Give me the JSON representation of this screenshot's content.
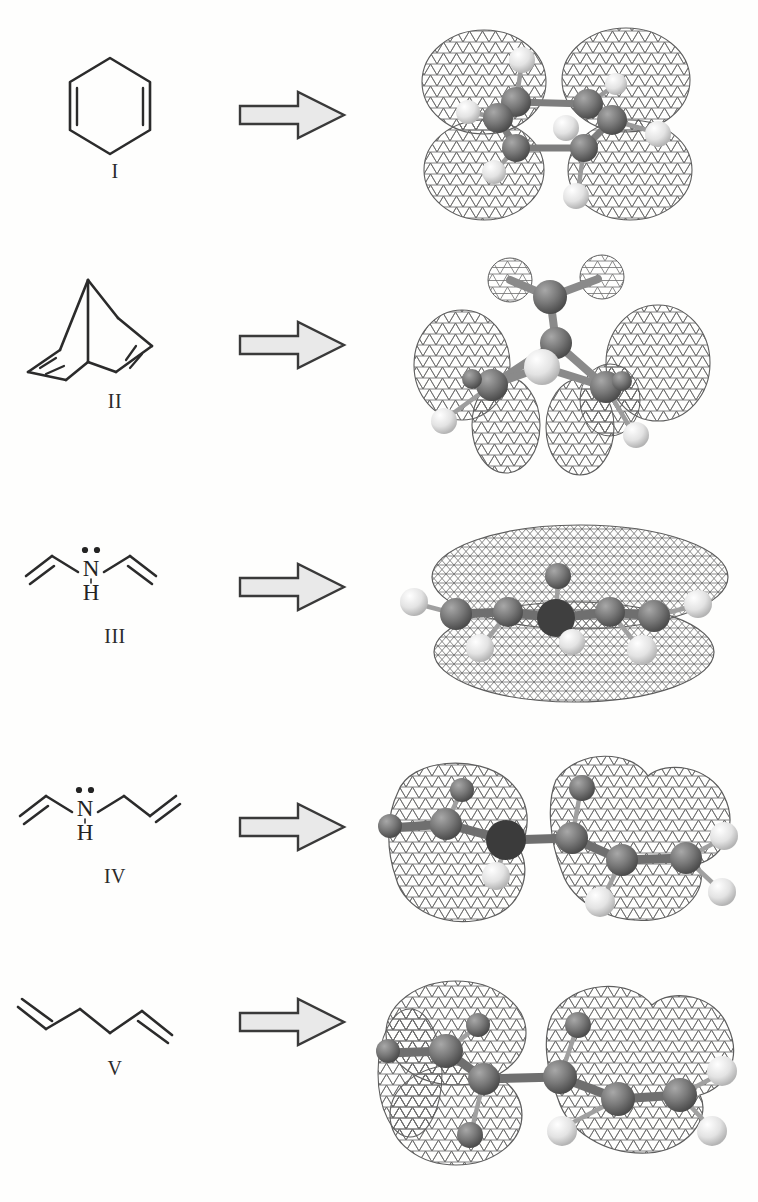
{
  "figure": {
    "type": "chemistry-scheme",
    "background_color": "#fdfdfc",
    "ink_color": "#2b2b2b",
    "arrow_fill": "#e9e9e9",
    "arrow_stroke": "#3a3a3a",
    "mesh_color": "#5a5a5a",
    "carbon_color": "#6b6b6b",
    "hydrogen_color": "#e8e8e8"
  },
  "rows": [
    {
      "label": "I",
      "structure_name": "1,3-cyclohexadiene",
      "structure_kind": "hexagon-diene",
      "arrow_icon": "block-arrow-right-icon",
      "mo_caption": "four-lobe pi antibonding isosurface",
      "mo_kind": "four-lobe"
    },
    {
      "label": "II",
      "structure_name": "norbornadiene",
      "structure_kind": "bicyclic-diene",
      "arrow_icon": "block-arrow-right-icon",
      "mo_caption": "through-space coupled pi lobes with bridging methylene",
      "mo_kind": "bridged-lobes"
    },
    {
      "label": "III",
      "structure_name": "divinylamine",
      "structure_kind": "divinylamine",
      "atom_label": "N",
      "hydrogen_label": "H",
      "lone_pair": "two-dot-lone-pair",
      "arrow_icon": "block-arrow-right-icon",
      "mo_caption": "delocalized pi sandwich isosurface above and below plane",
      "mo_kind": "sandwich"
    },
    {
      "label": "IV",
      "structure_name": "N-allyl-N-vinylamine",
      "structure_kind": "vinyl-allyl-amine",
      "atom_label": "N",
      "hydrogen_label": "H",
      "lone_pair": "two-dot-lone-pair",
      "arrow_icon": "block-arrow-right-icon",
      "mo_caption": "two separated lobe clusters on vinyl and allyl fragments",
      "mo_kind": "split-clusters"
    },
    {
      "label": "V",
      "structure_name": "1,5-hexadiene",
      "structure_kind": "hexadiene-chain",
      "arrow_icon": "block-arrow-right-icon",
      "mo_caption": "two localized pi lobe clusters on terminal alkenes",
      "mo_kind": "split-clusters"
    }
  ]
}
